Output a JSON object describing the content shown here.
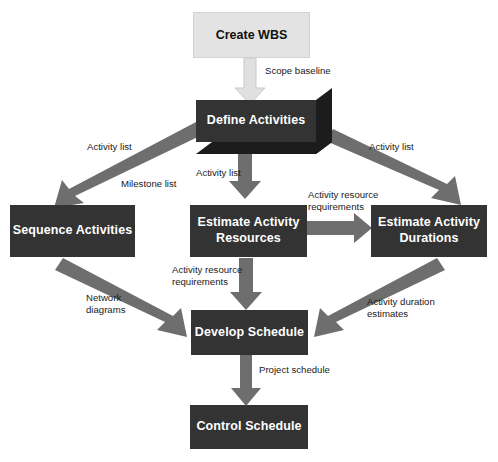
{
  "diagram": {
    "type": "process-flow-diagram",
    "colors": {
      "node_dark_fill": "#333333",
      "node_dark_text": "#ffffff",
      "node_light_fill": "#e3e3e3",
      "node_light_text": "#111111",
      "node_3d_side": "#222222",
      "arrow_gray": "#6e6e6e",
      "arrow_light": "#e0e0e0",
      "background": "#ffffff",
      "label_text": "#1a1a1a"
    },
    "nodes": [
      {
        "id": "create-wbs",
        "label": "Create WBS",
        "style": "light"
      },
      {
        "id": "define-activities",
        "label": "Define Activities",
        "style": "dark-3d"
      },
      {
        "id": "sequence-activities",
        "label": "Sequence Activities",
        "style": "dark"
      },
      {
        "id": "estimate-activity-resources",
        "label": "Estimate Activity\nResources",
        "line1": "Estimate Activity",
        "line2": "Resources",
        "style": "dark"
      },
      {
        "id": "estimate-activity-durations",
        "label": "Estimate Activity\nDurations",
        "line1": "Estimate Activity",
        "line2": "Durations",
        "style": "dark"
      },
      {
        "id": "develop-schedule",
        "label": "Develop Schedule",
        "style": "dark"
      },
      {
        "id": "control-schedule",
        "label": "Control Schedule",
        "style": "dark"
      }
    ],
    "edges": [
      {
        "id": "wbs-to-define",
        "from": "create-wbs",
        "to": "define-activities",
        "label": "Scope baseline",
        "arrow_style": "light"
      },
      {
        "id": "define-to-sequence",
        "from": "define-activities",
        "to": "sequence-activities",
        "label_1": "Activity list",
        "label_2": "Milestone list",
        "arrow_style": "gray"
      },
      {
        "id": "define-to-resources",
        "from": "define-activities",
        "to": "estimate-activity-resources",
        "label": "Activity list",
        "arrow_style": "gray"
      },
      {
        "id": "define-to-durations",
        "from": "define-activities",
        "to": "estimate-activity-durations",
        "label": "Activity list",
        "arrow_style": "gray"
      },
      {
        "id": "resources-to-durations",
        "from": "estimate-activity-resources",
        "to": "estimate-activity-durations",
        "label_1": "Activity resource",
        "label_2": "requirements",
        "arrow_style": "gray"
      },
      {
        "id": "sequence-to-develop",
        "from": "sequence-activities",
        "to": "develop-schedule",
        "label_1": "Network",
        "label_2": "diagrams",
        "arrow_style": "gray"
      },
      {
        "id": "resources-to-develop",
        "from": "estimate-activity-resources",
        "to": "develop-schedule",
        "label_1": "Activity resource",
        "label_2": "requirements",
        "arrow_style": "gray"
      },
      {
        "id": "durations-to-develop",
        "from": "estimate-activity-durations",
        "to": "develop-schedule",
        "label_1": "Activity duration",
        "label_2": "estimates",
        "arrow_style": "gray"
      },
      {
        "id": "develop-to-control",
        "from": "develop-schedule",
        "to": "control-schedule",
        "label": "Project schedule",
        "arrow_style": "gray"
      }
    ],
    "labels": {
      "scope_baseline": "Scope baseline",
      "activity_list_left": "Activity list",
      "milestone_list": "Milestone list",
      "activity_list_center": "Activity list",
      "activity_list_right": "Activity list",
      "activity_resource_requirements_top": "Activity resource\nrequirements",
      "activity_resource_requirements_mid": "Activity resource\nrequirements",
      "network_diagrams": "Network\ndiagrams",
      "activity_duration_estimates": "Activity duration\nestimates",
      "project_schedule": "Project schedule"
    }
  }
}
